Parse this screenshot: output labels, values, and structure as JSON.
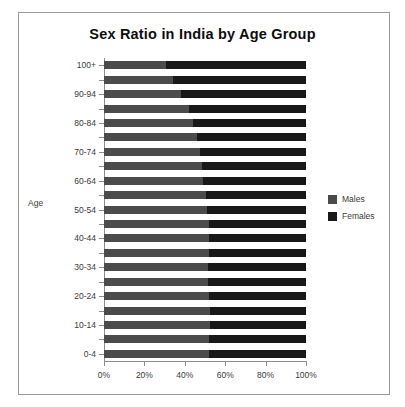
{
  "chart_data": {
    "type": "bar",
    "subtype": "stacked-horizontal-100pct",
    "title": "Sex Ratio in India by Age Group",
    "xlabel": "",
    "ylabel": "Age",
    "orientation": "horizontal",
    "grid": false,
    "legend_position": "right",
    "xlim": [
      0,
      100
    ],
    "xtick_labels": [
      "0%",
      "20%",
      "40%",
      "60%",
      "80%",
      "100%"
    ],
    "xtick_values": [
      0,
      20,
      40,
      60,
      80,
      100
    ],
    "categories": [
      "0-4",
      "5-9",
      "10-14",
      "15-19",
      "20-24",
      "25-29",
      "30-34",
      "35-39",
      "40-44",
      "45-49",
      "50-54",
      "55-59",
      "60-64",
      "65-69",
      "70-74",
      "75-79",
      "80-84",
      "85-89",
      "90-94",
      "95-99",
      "100+"
    ],
    "ytick_labels_shown": [
      "0-4",
      "10-14",
      "20-24",
      "30-34",
      "40-44",
      "50-54",
      "60-64",
      "70-74",
      "80-84",
      "90-94",
      "100+"
    ],
    "series": [
      {
        "name": "Males",
        "color": "#4b4b4b",
        "values": [
          52.0,
          52.2,
          52.4,
          52.6,
          52.0,
          51.5,
          51.6,
          51.8,
          52.0,
          51.8,
          51.2,
          50.4,
          49.2,
          48.4,
          47.6,
          46.2,
          44.0,
          42.0,
          38.0,
          34.0,
          30.5
        ]
      },
      {
        "name": "Females",
        "color": "#181818",
        "values": [
          48.0,
          47.8,
          47.6,
          47.4,
          48.0,
          48.5,
          48.4,
          48.2,
          48.0,
          48.2,
          48.8,
          49.6,
          50.8,
          51.6,
          52.4,
          53.8,
          56.0,
          58.0,
          62.0,
          66.0,
          69.5
        ]
      }
    ]
  },
  "legend": {
    "items": [
      {
        "label": "Males"
      },
      {
        "label": "Females"
      }
    ]
  }
}
